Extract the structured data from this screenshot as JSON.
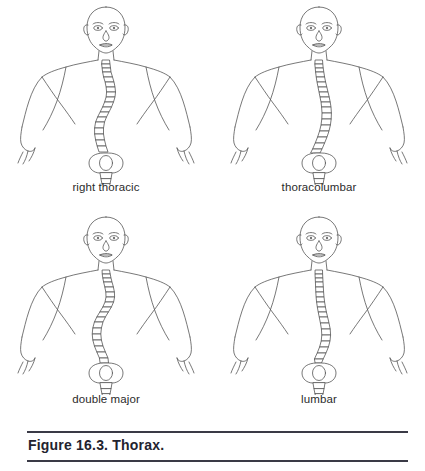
{
  "figure": {
    "caption": "Figure 16.3. Thorax.",
    "rule_color": "#3a3a46",
    "outline_color": "#555555",
    "background_color": "#ffffff",
    "label_color": "#2b2b2b"
  },
  "panels": [
    {
      "id": "right-thoracic",
      "label": "right thoracic",
      "curve_description": "S-shaped curve: thoracic convexity to the right with compensatory lumbar curve to the left",
      "spine_path": "M 0,0 C 3,10 9,19 11,29 C 13,40 9,50 4,59 C -1,68 -4,77 -2,86 C 0,95 1,100 1,104",
      "vertebra_count": 24
    },
    {
      "id": "thoracolumbar",
      "label": "thoracolumbar",
      "curve_description": "Single long C-curve through the thoracolumbar junction, convex to the right",
      "spine_path": "M 0,0 C 2,12 6,24 9,36 C 12,49 13,62 10,74 C 7,86 3,96 1,104",
      "vertebra_count": 24
    },
    {
      "id": "double-major",
      "label": "double major",
      "curve_description": "Double major curve: two structural curves, thoracic right and lumbar left",
      "spine_path": "M 0,0 C 4,9 9,17 10,26 C 11,36 6,44 1,52 C -4,60 -7,69 -4,78 C -1,87 2,95 3,104",
      "vertebra_count": 24
    },
    {
      "id": "lumbar",
      "label": "lumbar",
      "curve_description": "Lumbar curve: straight upper spine with lower lumbar convexity to the right",
      "spine_path": "M 0,0 C 1,12 2,25 3,38 C 4,51 7,63 10,74 C 12,85 9,95 4,104",
      "vertebra_count": 24
    }
  ]
}
